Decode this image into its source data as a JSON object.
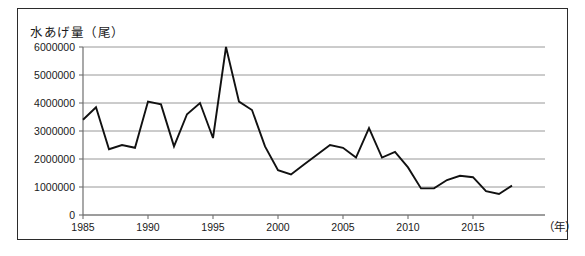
{
  "figure": {
    "axis_title": "水あげ量（尾）",
    "x_unit_label": "（年）",
    "frame_color": "#2b2b2b",
    "line_color": "#111111",
    "grid_color": "#8c8c8c"
  },
  "chart_data": {
    "type": "line",
    "title": "水あげ量（尾）",
    "xlabel": "（年）",
    "ylabel": "水あげ量（尾）",
    "xlim": [
      1985,
      2018
    ],
    "ylim": [
      0,
      6000000
    ],
    "grid": true,
    "legend": "none",
    "y_ticks": [
      0,
      1000000,
      2000000,
      3000000,
      4000000,
      5000000,
      6000000
    ],
    "y_tick_labels": [
      "0",
      "1000000",
      "2000000",
      "3000000",
      "4000000",
      "5000000",
      "6000000"
    ],
    "x_ticks": [
      1985,
      1990,
      1995,
      2000,
      2005,
      2010,
      2015
    ],
    "x_tick_labels": [
      "1985",
      "1990",
      "1995",
      "2000",
      "2005",
      "2010",
      "2015"
    ],
    "x": [
      1985,
      1986,
      1987,
      1988,
      1989,
      1990,
      1991,
      1992,
      1993,
      1994,
      1995,
      1996,
      1997,
      1998,
      1999,
      2000,
      2001,
      2002,
      2003,
      2004,
      2005,
      2006,
      2007,
      2008,
      2009,
      2010,
      2011,
      2012,
      2013,
      2014,
      2015,
      2016,
      2017,
      2018
    ],
    "series": [
      {
        "name": "水あげ量",
        "values": [
          3400000,
          3850000,
          2350000,
          2500000,
          2400000,
          4050000,
          3950000,
          2450000,
          3600000,
          4000000,
          2750000,
          6000000,
          4050000,
          3750000,
          2450000,
          1600000,
          1450000,
          1800000,
          2150000,
          2500000,
          2400000,
          2050000,
          3100000,
          2050000,
          2250000,
          1700000,
          950000,
          950000,
          1250000,
          1400000,
          1350000,
          850000,
          750000,
          1050000
        ]
      }
    ]
  }
}
